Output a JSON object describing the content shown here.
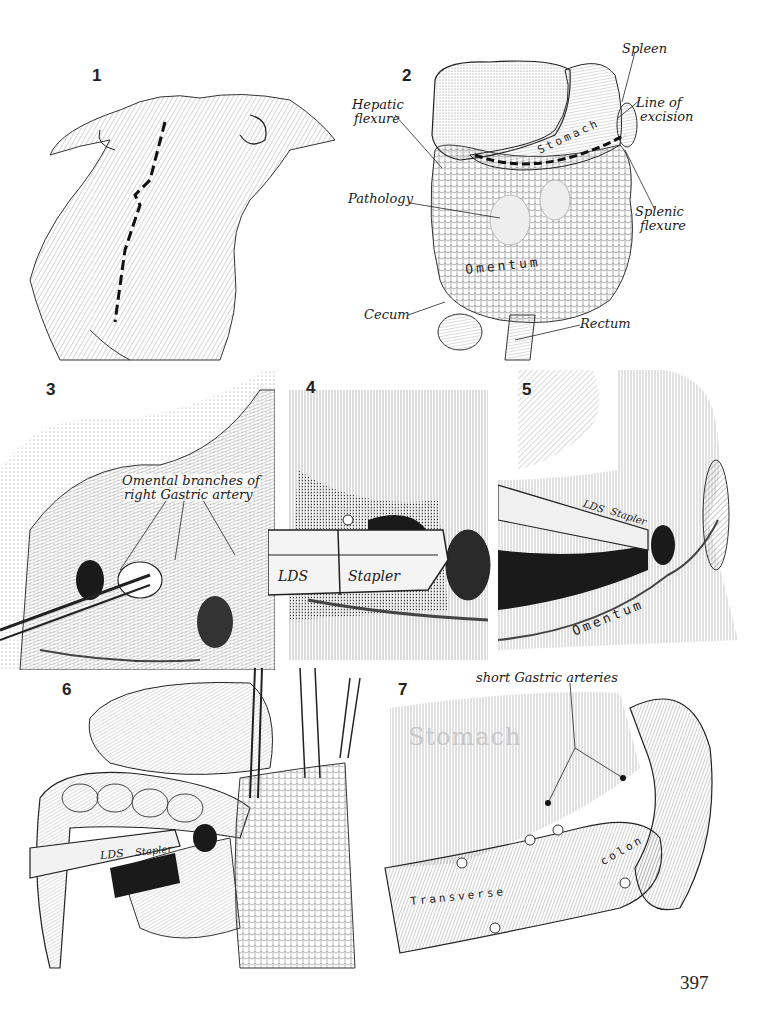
{
  "page": {
    "page_number": "397",
    "background": "#ffffff",
    "ink_color": "#1a1a1a"
  },
  "figures": [
    {
      "number": "1",
      "labels": []
    },
    {
      "number": "2",
      "labels": [
        "Spleen",
        "Hepatic flexure",
        "Line of excision",
        "Stomach",
        "Pathology",
        "Splenic flexure",
        "Omentum",
        "Cecum",
        "Rectum"
      ]
    },
    {
      "number": "3",
      "labels": [
        "Omental branches of right Gastric artery"
      ]
    },
    {
      "number": "4",
      "labels": [
        "LDS",
        "Stapler"
      ]
    },
    {
      "number": "5",
      "labels": [
        "LDS",
        "Stapler",
        "Omentum"
      ]
    },
    {
      "number": "6",
      "labels": [
        "LDS",
        "Stapler"
      ]
    },
    {
      "number": "7",
      "labels": [
        "short Gastric arteries",
        "Stomach",
        "Transverse colon"
      ]
    }
  ],
  "fig1": {
    "num": "1"
  },
  "fig2": {
    "num": "2",
    "spleen": "Spleen",
    "hepatic_1": "Hepatic",
    "hepatic_2": "flexure",
    "line_1": "Line of",
    "line_2": "excision",
    "stomach": "Stomach",
    "pathology": "Pathology",
    "splenic_1": "Splenic",
    "splenic_2": "flexure",
    "omentum": "Omentum",
    "cecum": "Cecum",
    "rectum": "Rectum"
  },
  "fig3": {
    "num": "3",
    "label_1": "Omental branches of",
    "label_2": "right Gastric artery"
  },
  "fig4": {
    "num": "4",
    "lds": "LDS",
    "stapler": "Stapler"
  },
  "fig5": {
    "num": "5",
    "lds": "LDS",
    "stapler": "Stapler",
    "omentum": "Omentum"
  },
  "fig6": {
    "num": "6",
    "lds": "LDS",
    "stapler": "Stapler"
  },
  "fig7": {
    "num": "7",
    "arteries": "short Gastric arteries",
    "stomach": "Stomach",
    "colon_1": "Transverse",
    "colon_2": "colon"
  }
}
